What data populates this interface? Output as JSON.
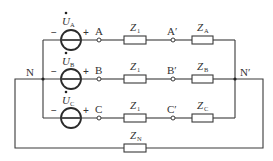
{
  "diagram": {
    "type": "three-phase circuit",
    "nodes": {
      "N": "N",
      "N_prime": "N′",
      "A": "A",
      "B": "B",
      "C": "C",
      "A_prime": "A′",
      "B_prime": "B′",
      "C_prime": "C′"
    },
    "sources": [
      {
        "symbol": "U",
        "sub": "A",
        "minus": "−",
        "plus": "+"
      },
      {
        "symbol": "U",
        "sub": "B",
        "minus": "−",
        "plus": "+"
      },
      {
        "symbol": "U",
        "sub": "C",
        "minus": "−",
        "plus": "+"
      }
    ],
    "impedances": {
      "line": [
        {
          "symbol": "Z",
          "sub": "1"
        },
        {
          "symbol": "Z",
          "sub": "1"
        },
        {
          "symbol": "Z",
          "sub": "1"
        }
      ],
      "load": [
        {
          "symbol": "Z",
          "sub": "A"
        },
        {
          "symbol": "Z",
          "sub": "B"
        },
        {
          "symbol": "Z",
          "sub": "C"
        }
      ],
      "neutral": {
        "symbol": "Z",
        "sub": "N"
      }
    }
  }
}
